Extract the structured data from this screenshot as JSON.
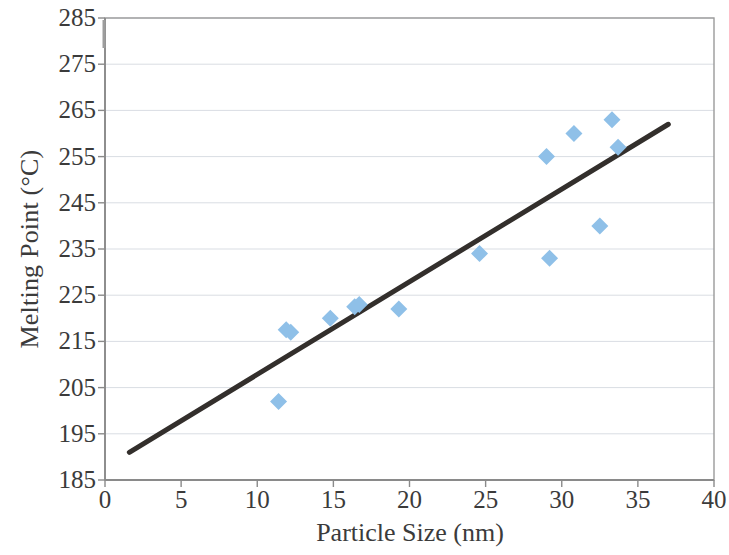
{
  "chart_data": {
    "type": "scatter",
    "title": "",
    "xlabel": "Particle Size (nm)",
    "ylabel": "Melting Point (°C)",
    "xlim": [
      0,
      40
    ],
    "ylim": [
      185,
      285
    ],
    "xticks": [
      0,
      5,
      10,
      15,
      20,
      25,
      30,
      35,
      40
    ],
    "yticks": [
      185,
      195,
      205,
      215,
      225,
      235,
      245,
      255,
      265,
      275,
      285
    ],
    "xtick_labels": [
      "0",
      "5",
      "10",
      "15",
      "20",
      "25",
      "30",
      "35",
      "40"
    ],
    "ytick_labels": [
      "185",
      "195",
      "205",
      "215",
      "225",
      "235",
      "245",
      "255",
      "265",
      "275",
      "285"
    ],
    "grid": "horizontal",
    "legend": "none",
    "marker": "diamond",
    "marker_color": "#8FC0E8",
    "trendline_color": "#332F2C",
    "axis_color": "#9a9a9a",
    "gridline_color": "#d9dde3",
    "series": [
      {
        "name": "Melting Point vs Particle Size",
        "points": [
          [
            11.4,
            202.0
          ],
          [
            11.9,
            217.5
          ],
          [
            12.2,
            217.0
          ],
          [
            14.8,
            220.0
          ],
          [
            16.4,
            222.5
          ],
          [
            16.7,
            223.0
          ],
          [
            19.3,
            222.0
          ],
          [
            24.6,
            234.0
          ],
          [
            29.0,
            255.0
          ],
          [
            29.2,
            233.0
          ],
          [
            30.8,
            260.0
          ],
          [
            32.5,
            240.0
          ],
          [
            33.3,
            263.0
          ],
          [
            33.7,
            257.0
          ]
        ]
      }
    ],
    "trendline": {
      "type": "linear",
      "x_start": 1.6,
      "y_start": 191.0,
      "x_end": 37.0,
      "y_end": 262.0
    }
  }
}
